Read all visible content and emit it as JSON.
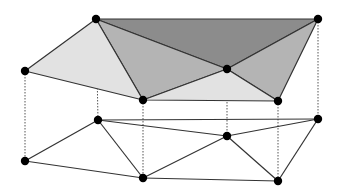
{
  "diagram": {
    "type": "tin-surface-over-planar-triangulation",
    "colors": {
      "background": "#ffffff",
      "edge": "#333333",
      "dashed": "#555555",
      "vertex": "#000000",
      "face_dark": "#8c8c8c",
      "face_medium": "#b4b4b4",
      "face_light": "#e2e2e2"
    },
    "top_vertices": {
      "A": [
        96,
        19
      ],
      "B": [
        318,
        19
      ],
      "C": [
        25,
        71
      ],
      "D": [
        227,
        69
      ],
      "E": [
        143,
        100
      ],
      "F": [
        278,
        101
      ]
    },
    "bottom_vertices": {
      "a": [
        98,
        120
      ],
      "b": [
        318,
        119
      ],
      "c": [
        25,
        161
      ],
      "d": [
        227,
        136
      ],
      "e": [
        143,
        178
      ],
      "f": [
        278,
        181
      ]
    },
    "top_faces": [
      {
        "id": "ABD",
        "shade": "face_dark"
      },
      {
        "id": "ADE",
        "shade": "face_medium"
      },
      {
        "id": "DBF",
        "shade": "face_medium"
      },
      {
        "id": "ACE",
        "shade": "face_light"
      },
      {
        "id": "EDF",
        "shade": "face_light"
      }
    ],
    "bottom_edges": [
      "ca",
      "ab",
      "ad",
      "db",
      "ce",
      "ae",
      "ed",
      "df",
      "bf",
      "ef"
    ],
    "vertical_links": [
      "Aa",
      "Bb",
      "Cc",
      "Dd",
      "Ee",
      "Ff"
    ]
  }
}
